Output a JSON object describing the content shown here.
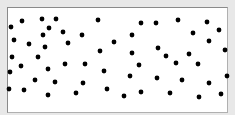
{
  "chart_data": {
    "type": "scatter",
    "title": "",
    "xlabel": "",
    "ylabel": "",
    "grid": false,
    "legend": null,
    "axis_ticks": false,
    "marker_color": "#000000",
    "marker_radius": 2.4,
    "frame": {
      "x": 7,
      "y": 7,
      "width": 221,
      "height": 106,
      "background": "#ffffff",
      "border": "#8a8a8a",
      "page_background": "#e8e8e8"
    },
    "points_pixel_coords": [
      [
        11,
        27
      ],
      [
        22,
        21
      ],
      [
        42,
        19
      ],
      [
        56,
        19
      ],
      [
        98,
        20
      ],
      [
        49,
        28
      ],
      [
        63,
        32
      ],
      [
        82,
        35
      ],
      [
        43,
        35
      ],
      [
        14,
        40
      ],
      [
        29,
        44
      ],
      [
        68,
        43
      ],
      [
        45,
        47
      ],
      [
        114,
        42
      ],
      [
        100,
        51
      ],
      [
        12,
        57
      ],
      [
        38,
        57
      ],
      [
        141,
        23
      ],
      [
        156,
        23
      ],
      [
        178,
        20
      ],
      [
        207,
        22
      ],
      [
        132,
        35
      ],
      [
        193,
        33
      ],
      [
        219,
        30
      ],
      [
        209,
        41
      ],
      [
        132,
        53
      ],
      [
        158,
        48
      ],
      [
        166,
        56
      ],
      [
        189,
        54
      ],
      [
        225,
        50
      ],
      [
        10,
        72
      ],
      [
        21,
        66
      ],
      [
        48,
        69
      ],
      [
        65,
        64
      ],
      [
        85,
        64
      ],
      [
        104,
        71
      ],
      [
        35,
        80
      ],
      [
        55,
        82
      ],
      [
        83,
        83
      ],
      [
        9,
        89
      ],
      [
        24,
        90
      ],
      [
        48,
        95
      ],
      [
        76,
        93
      ],
      [
        107,
        89
      ],
      [
        139,
        65
      ],
      [
        176,
        63
      ],
      [
        198,
        64
      ],
      [
        130,
        76
      ],
      [
        157,
        78
      ],
      [
        182,
        80
      ],
      [
        209,
        83
      ],
      [
        227,
        76
      ],
      [
        124,
        96
      ],
      [
        141,
        92
      ],
      [
        170,
        93
      ],
      [
        199,
        97
      ],
      [
        221,
        94
      ]
    ]
  }
}
